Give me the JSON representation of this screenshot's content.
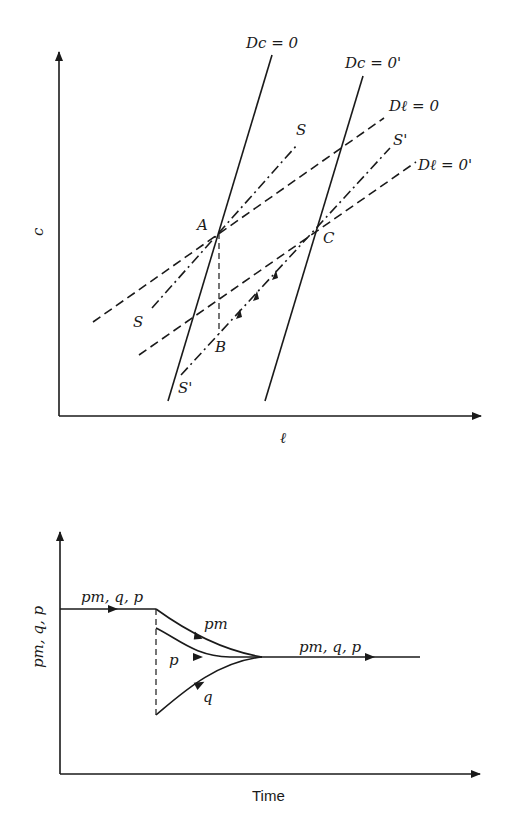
{
  "top_panel": {
    "y_axis_label": "c",
    "x_axis_label": "ℓ",
    "curves": {
      "dc0": "Dc = 0",
      "dc0_shift": "Dc = 0'",
      "dl0": "Dℓ = 0",
      "dl0_shift": "Dℓ = 0'",
      "s_upper": "S",
      "s_lower": "S",
      "sprime_upper": "S'",
      "sprime_lower": "S'"
    },
    "points": {
      "a": "A",
      "b": "B",
      "c": "C"
    }
  },
  "bottom_panel": {
    "y_axis_label": "pm, q, p",
    "x_axis_label": "Time",
    "labels": {
      "initial": "pm, q, p",
      "pm": "pm",
      "p": "p",
      "q": "q",
      "final": "pm, q, p"
    }
  }
}
